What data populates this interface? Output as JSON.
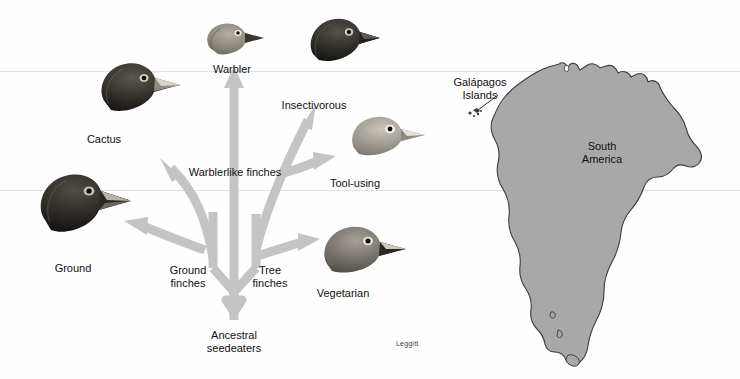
{
  "figure": {
    "credit": "Leggitt",
    "background_color": "#fefefe",
    "arrow_color": "#c4c4c4",
    "map_fill_color": "#a8a8a8",
    "map_outline_color": "#3c3c3c",
    "text_color": "#111111"
  },
  "tree": {
    "root": {
      "label": "Ancestral\nseedeaters"
    },
    "branches": [
      {
        "label": "Ground\nfinches"
      },
      {
        "label": "Tree\nfinches"
      },
      {
        "label": "Warblerlike finches"
      }
    ]
  },
  "finches": [
    {
      "name": "Warbler",
      "label": "Warbler"
    },
    {
      "name": "Cactus",
      "label": "Cactus"
    },
    {
      "name": "Insectivorous",
      "label": "Insectivorous"
    },
    {
      "name": "Tool-using",
      "label": "Tool-using"
    },
    {
      "name": "Ground",
      "label": "Ground"
    },
    {
      "name": "Vegetarian",
      "label": "Vegetarian"
    }
  ],
  "map": {
    "continent_label": "South\nAmerica",
    "islands_label": "Galápagos\nIslands"
  }
}
